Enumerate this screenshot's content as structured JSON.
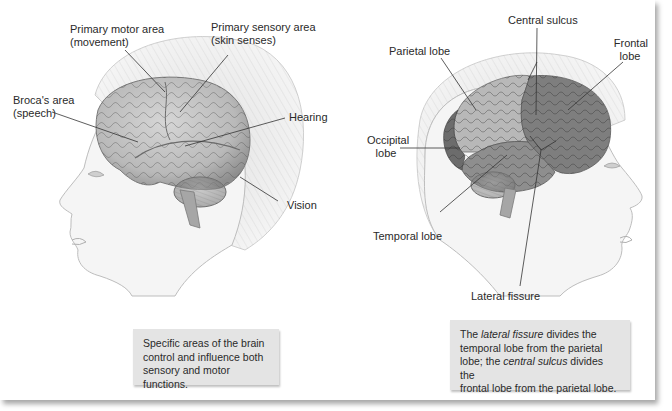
{
  "left_figure": {
    "labels": {
      "primary_motor_line1": "Primary motor area",
      "primary_motor_line2": "(movement)",
      "primary_sensory_line1": "Primary sensory area",
      "primary_sensory_line2": "(skin senses)",
      "broca_line1": "Broca's area",
      "broca_line2": "(speech)",
      "hearing": "Hearing",
      "vision": "Vision"
    },
    "caption": {
      "line1": "Specific areas of the brain",
      "line2": "control and influence both",
      "line3": "sensory and motor functions."
    }
  },
  "right_figure": {
    "labels": {
      "central_sulcus": "Central sulcus",
      "parietal_lobe": "Parietal lobe",
      "frontal_line1": "Frontal",
      "frontal_line2": "lobe",
      "occipital_line1": "Occipital",
      "occipital_line2": "lobe",
      "temporal_lobe": "Temporal lobe",
      "lateral_fissure": "Lateral fissure"
    },
    "caption": {
      "t1": "The ",
      "t2_italic": "lateral fissure",
      "t3": " divides the",
      "t4": "temporal lobe from the parietal",
      "t5": "lobe; the ",
      "t6_italic": "central sulcus",
      "t7": " divides the",
      "t8": "frontal lobe from the parietal lobe."
    }
  },
  "colors": {
    "hair": "#ececec",
    "skin": "#f4f4f4",
    "brain_light": "#c9c9c9",
    "parietal": "#b5b5b5",
    "frontal": "#7f7f7f",
    "temporal": "#8d8d8d",
    "occipital": "#6c6c6c",
    "caption_bg": "#e4e4e4"
  }
}
